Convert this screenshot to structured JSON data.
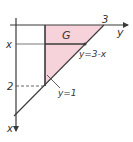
{
  "figure": {
    "region_label": "G",
    "axis_x_label": "x",
    "axis_y_label": "y",
    "tick_y_3": "3",
    "tick_x_x": "x",
    "tick_x_2": "2",
    "line_diagonal_label": "y=3-x",
    "line_vertical_label": "y=1",
    "colors": {
      "fill": "#f6d3da",
      "line": "#3a3a3a",
      "text": "#333333"
    }
  }
}
